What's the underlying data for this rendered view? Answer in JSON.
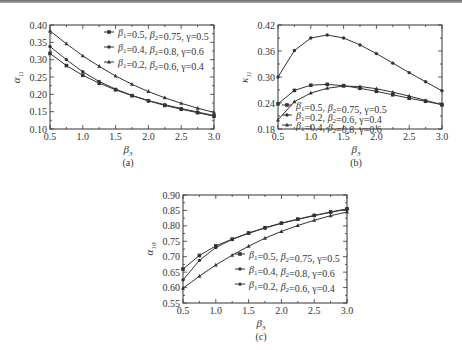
{
  "chart_data": [
    {
      "id": "a",
      "type": "line",
      "caption": "(a)",
      "xlabel": "β3",
      "ylabel": "α11",
      "xlim": [
        0.5,
        3.0
      ],
      "ylim": [
        0.1,
        0.4
      ],
      "xticks": [
        "0.5",
        "1.0",
        "1.5",
        "2.0",
        "2.5",
        "3.0"
      ],
      "yticks": [
        "0.10",
        "0.15",
        "0.20",
        "0.25",
        "0.30",
        "0.35",
        "0.40"
      ],
      "legend_position": "upper right",
      "x": [
        0.5,
        0.75,
        1.0,
        1.25,
        1.5,
        1.75,
        2.0,
        2.25,
        2.5,
        2.75,
        3.0
      ],
      "series": [
        {
          "name": "β1=0.5, β2=0.75, γ=0.5",
          "marker": "square",
          "values": [
            0.318,
            0.283,
            0.255,
            0.232,
            0.213,
            0.196,
            0.181,
            0.168,
            0.157,
            0.147,
            0.137
          ]
        },
        {
          "name": "β1=0.4, β2=0.8, γ=0.6",
          "marker": "circle",
          "values": [
            0.338,
            0.3,
            0.265,
            0.237,
            0.215,
            0.197,
            0.182,
            0.17,
            0.159,
            0.149,
            0.139
          ]
        },
        {
          "name": "β1=0.2, β2=0.6, γ=0.4",
          "marker": "triangle",
          "values": [
            0.383,
            0.346,
            0.311,
            0.281,
            0.253,
            0.229,
            0.208,
            0.19,
            0.174,
            0.16,
            0.148
          ]
        }
      ]
    },
    {
      "id": "b",
      "type": "line",
      "caption": "(b)",
      "xlabel": "β3",
      "ylabel": "κ11",
      "xlim": [
        0.5,
        3.0
      ],
      "ylim": [
        0.18,
        0.42
      ],
      "xticks": [
        "0.5",
        "1.0",
        "1.5",
        "2.0",
        "2.5",
        "3.0"
      ],
      "yticks": [
        "0.18",
        "0.24",
        "0.30",
        "0.36",
        "0.42"
      ],
      "legend_position": "lower left",
      "x": [
        0.5,
        0.75,
        1.0,
        1.25,
        1.5,
        1.75,
        2.0,
        2.25,
        2.5,
        2.75,
        3.0
      ],
      "series": [
        {
          "name": "β1=0.5, β2=0.75, γ=0.5",
          "marker": "square",
          "values": [
            0.238,
            0.269,
            0.281,
            0.283,
            0.28,
            0.274,
            0.267,
            0.259,
            0.251,
            0.244,
            0.236
          ]
        },
        {
          "name": "β1=0.2, β2=0.6, γ=0.4",
          "marker": "circle",
          "values": [
            0.3,
            0.361,
            0.39,
            0.397,
            0.39,
            0.374,
            0.354,
            0.332,
            0.31,
            0.289,
            0.268
          ]
        },
        {
          "name": "β1=0.4, β2=0.8, γ=0.6",
          "marker": "triangle",
          "values": [
            0.201,
            0.243,
            0.263,
            0.274,
            0.279,
            0.278,
            0.273,
            0.265,
            0.256,
            0.246,
            0.236
          ]
        }
      ]
    },
    {
      "id": "c",
      "type": "line",
      "caption": "(c)",
      "xlabel": "β3",
      "ylabel": "α10",
      "xlim": [
        0.5,
        3.0
      ],
      "ylim": [
        0.55,
        0.9
      ],
      "xticks": [
        "0.5",
        "1.0",
        "1.5",
        "2.0",
        "2.5",
        "3.0"
      ],
      "yticks": [
        "0.55",
        "0.60",
        "0.65",
        "0.70",
        "0.75",
        "0.80",
        "0.85",
        "0.90"
      ],
      "legend_position": "lower right",
      "x": [
        0.5,
        0.75,
        1.0,
        1.25,
        1.5,
        1.75,
        2.0,
        2.25,
        2.5,
        2.75,
        3.0
      ],
      "series": [
        {
          "name": "β1=0.5, β2=0.75, γ=0.5",
          "marker": "square",
          "values": [
            0.66,
            0.704,
            0.735,
            0.757,
            0.777,
            0.794,
            0.809,
            0.822,
            0.834,
            0.845,
            0.855
          ]
        },
        {
          "name": "β1=0.4, β2=0.8, γ=0.6",
          "marker": "circle",
          "values": [
            0.625,
            0.688,
            0.73,
            0.756,
            0.776,
            0.793,
            0.808,
            0.821,
            0.833,
            0.844,
            0.854
          ]
        },
        {
          "name": "β1=0.2, β2=0.6, γ=0.4",
          "marker": "triangle",
          "values": [
            0.598,
            0.637,
            0.673,
            0.705,
            0.734,
            0.76,
            0.782,
            0.801,
            0.818,
            0.833,
            0.845
          ]
        }
      ]
    }
  ],
  "layout": {
    "panels": [
      {
        "left": 50,
        "top": 25,
        "right": 214,
        "bottom": 129,
        "legend": {
          "x": 112,
          "y": 32,
          "dy": 15
        }
      },
      {
        "left": 278,
        "top": 25,
        "right": 442,
        "bottom": 129,
        "legend": {
          "x": 290,
          "y": 105,
          "dy": 10
        }
      },
      {
        "left": 183,
        "top": 195,
        "right": 347,
        "bottom": 303,
        "legend": {
          "x": 243,
          "y": 254,
          "dy": 15
        }
      }
    ],
    "line_color": "#333333"
  }
}
